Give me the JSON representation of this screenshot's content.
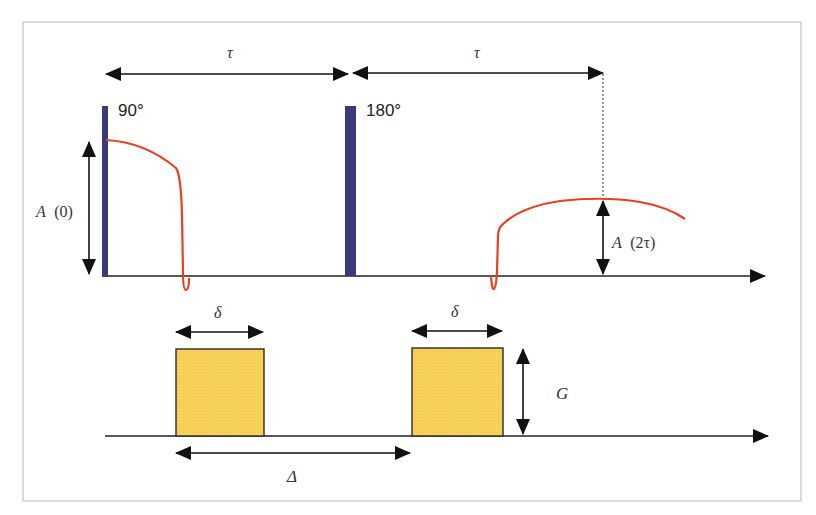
{
  "diagram": {
    "colors": {
      "frame": "#bdbdbd",
      "rf_pulse": "#3a3a7a",
      "signal": "#e8401c",
      "gradient_fill": "#f7d25a",
      "gradient_stroke": "#2a2a2a",
      "arrow": "#111111"
    },
    "rf_line": {
      "pulses": [
        {
          "label": "90°"
        },
        {
          "label": "180°"
        }
      ],
      "intervals": [
        {
          "label": "τ"
        },
        {
          "label": "τ"
        }
      ],
      "amplitudes": {
        "initial": {
          "italic": "A",
          "arg": "(0)"
        },
        "echo": {
          "italic": "A",
          "arg": "(2τ)"
        }
      }
    },
    "gradient_line": {
      "pulse_width_label": "δ",
      "pulse_width_label_2": "δ",
      "amplitude_label": "G",
      "separation_label": "Δ"
    }
  }
}
